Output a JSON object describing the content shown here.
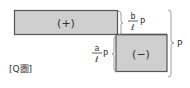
{
  "diagram": {
    "type": "shear-force-diagram",
    "caption": "[Q圖]",
    "positive_region": {
      "sign": "(+)",
      "magnitude_num": "b",
      "magnitude_den": "ℓ",
      "magnitude_var": "P"
    },
    "negative_region": {
      "sign": "(−)",
      "magnitude_num": "a",
      "magnitude_den": "ℓ",
      "magnitude_var": "P"
    },
    "total_label": "P",
    "colors": {
      "fill": "#cfcfcf",
      "stroke": "#555555",
      "brace": "#888888"
    }
  }
}
